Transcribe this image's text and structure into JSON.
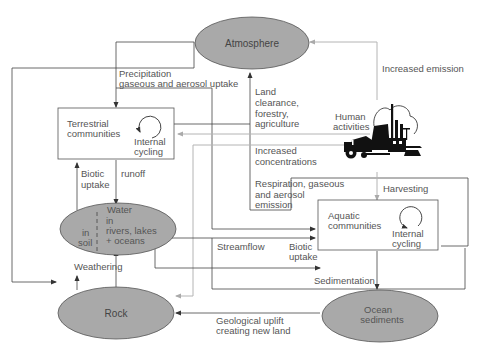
{
  "diagram": {
    "type": "nutrient-cycle-flow",
    "nodes": {
      "atmosphere": {
        "label": "Atmosphere",
        "shape": "ellipse"
      },
      "terrestrial": {
        "label_1": "Terrestrial",
        "label_2": "communities",
        "cycle_1": "Internal",
        "cycle_2": "cycling",
        "shape": "box"
      },
      "human": {
        "label_1": "Human",
        "label_2": "activities",
        "icon": "industry-tractor-illustration"
      },
      "water": {
        "title": "Water",
        "soil_1": "in",
        "soil_2": "soil",
        "water_1": "in",
        "water_2": "rivers, lakes",
        "water_3": "+ oceans",
        "shape": "ellipse"
      },
      "aquatic": {
        "label_1": "Aquatic",
        "label_2": "communities",
        "cycle_1": "Internal",
        "cycle_2": "cycling",
        "shape": "box"
      },
      "rock": {
        "label": "Rock",
        "shape": "ellipse"
      },
      "ocean": {
        "label_1": "Ocean",
        "label_2": "sediments",
        "shape": "ellipse"
      }
    },
    "edges": {
      "precipitation": {
        "line_1": "Precipitation",
        "line_2": "gaseous and aerosol uptake"
      },
      "increased_emission": {
        "label": "Increased emission"
      },
      "land_clearance": {
        "line_1": "Land",
        "line_2": "clearance,",
        "line_3": "forestry,",
        "line_4": "agriculture"
      },
      "increased_concentrations": {
        "line_1": "Increased",
        "line_2": "concentrations"
      },
      "respiration": {
        "line_1": "Respiration, gaseous",
        "line_2": "and aerosol",
        "line_3": "emission"
      },
      "harvesting": {
        "label": "Harvesting"
      },
      "biotic_uptake_terrestrial": {
        "line_1": "Biotic",
        "line_2": "uptake"
      },
      "runoff": {
        "label": "runoff"
      },
      "streamflow": {
        "label": "Streamflow"
      },
      "biotic_uptake_aquatic": {
        "line_1": "Biotic",
        "line_2": "uptake"
      },
      "sedimentation": {
        "label": "Sedimentation"
      },
      "weathering": {
        "label": "Weathering"
      },
      "geological_uplift": {
        "line_1": "Geological uplift",
        "line_2": "creating new land"
      }
    },
    "colors": {
      "node_fill": "#a9a9a9",
      "line_dark": "#444444",
      "line_light": "#b4b4b4",
      "text": "#555555"
    }
  }
}
